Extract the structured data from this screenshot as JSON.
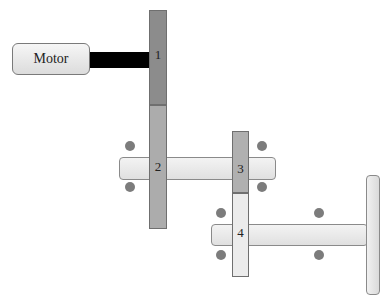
{
  "diagram": {
    "type": "gear-train-schematic",
    "motor": {
      "label": "Motor"
    },
    "gears": [
      {
        "id": "gear-1",
        "label": "1",
        "color": "#8c8c8c"
      },
      {
        "id": "gear-2",
        "label": "2",
        "color": "#acacac"
      },
      {
        "id": "gear-3",
        "label": "3",
        "color": "#b0b0b0"
      },
      {
        "id": "gear-4",
        "label": "4",
        "color": "#ececec"
      }
    ],
    "shafts": [
      {
        "id": "motor-shaft",
        "color": "#000000"
      },
      {
        "id": "intermediate-shaft",
        "carries": [
          "2",
          "3"
        ]
      },
      {
        "id": "output-shaft",
        "carries": [
          "4",
          "wheel"
        ]
      }
    ],
    "bearings_count": 8,
    "bearing_color": "#7c7c7c"
  }
}
